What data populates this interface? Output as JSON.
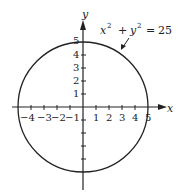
{
  "diagram": {
    "equation": {
      "base_x": "x",
      "exp_x": "2",
      "plus": "+",
      "base_y": "y",
      "exp_y": "2",
      "equals": "=",
      "rhs": "25"
    },
    "axis_labels": {
      "x": "x",
      "y": "y"
    },
    "x_ticks_neg": [
      "−4",
      "−3",
      "−2",
      "−1"
    ],
    "x_ticks_pos": [
      "1",
      "2",
      "3",
      "4",
      "5"
    ],
    "y_ticks": [
      "1",
      "2",
      "3",
      "4",
      "5"
    ],
    "circle": {
      "center": [
        0,
        0
      ],
      "radius": 5
    }
  }
}
